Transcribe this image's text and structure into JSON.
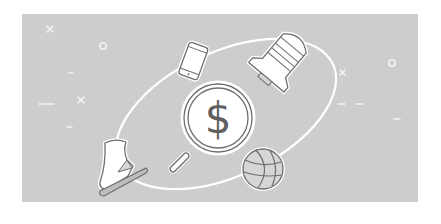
{
  "illustration": {
    "alt_text": "Magnifying glass with dollar sign surrounded by orbiting items: smartphone, space shuttle, ice skate, basketball",
    "colors": {
      "background": "#ffffff",
      "panel": "#cdcdcd",
      "orbit": "#ffffff",
      "outline": "#6e6e6e",
      "fill": "#ffffff",
      "accent_fill": "#d6d6d6"
    },
    "center": {
      "icon": "magnifying-glass-dollar-icon",
      "symbol": "$"
    },
    "orbit_items": [
      {
        "icon": "smartphone-icon"
      },
      {
        "icon": "space-shuttle-icon"
      },
      {
        "icon": "ice-skate-icon"
      },
      {
        "icon": "basketball-icon"
      }
    ],
    "decorations": [
      {
        "icon": "cross-icon"
      },
      {
        "icon": "circle-icon"
      },
      {
        "icon": "dash-icon"
      }
    ]
  }
}
